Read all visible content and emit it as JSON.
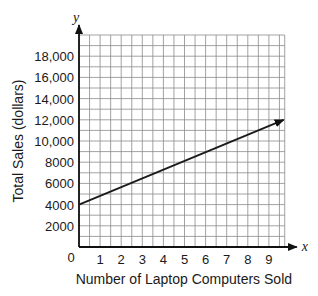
{
  "chart_data": {
    "type": "line",
    "title": "",
    "xlabel": "Number of Laptop Computers Sold",
    "ylabel": "Total Sales (dollars)",
    "x_axis_var": "x",
    "y_axis_var": "y",
    "origin_label": "0",
    "xlim": [
      0,
      9.75
    ],
    "ylim": [
      0,
      20000
    ],
    "x_ticks": [
      1,
      2,
      3,
      4,
      5,
      6,
      7,
      8,
      9
    ],
    "x_tick_labels": [
      "1",
      "2",
      "3",
      "4",
      "5",
      "6",
      "7",
      "8",
      "9"
    ],
    "y_ticks": [
      2000,
      4000,
      6000,
      8000,
      10000,
      12000,
      14000,
      16000,
      18000
    ],
    "y_tick_labels": [
      "2000",
      "4000",
      "6000",
      "8000",
      "10,000",
      "12,000",
      "14,000",
      "16,000",
      "18,000"
    ],
    "grid": true,
    "grid_x_step": 0.5,
    "grid_y_step": 1000,
    "series": [
      {
        "name": "Total Sales",
        "x": [
          0,
          9.7
        ],
        "y": [
          4000,
          12000
        ],
        "arrow_end": true,
        "color": "#1a1a1a"
      }
    ],
    "legend": null
  },
  "colors": {
    "grid": "#8a8a8a",
    "axis": "#111111",
    "line": "#1a1a1a"
  }
}
